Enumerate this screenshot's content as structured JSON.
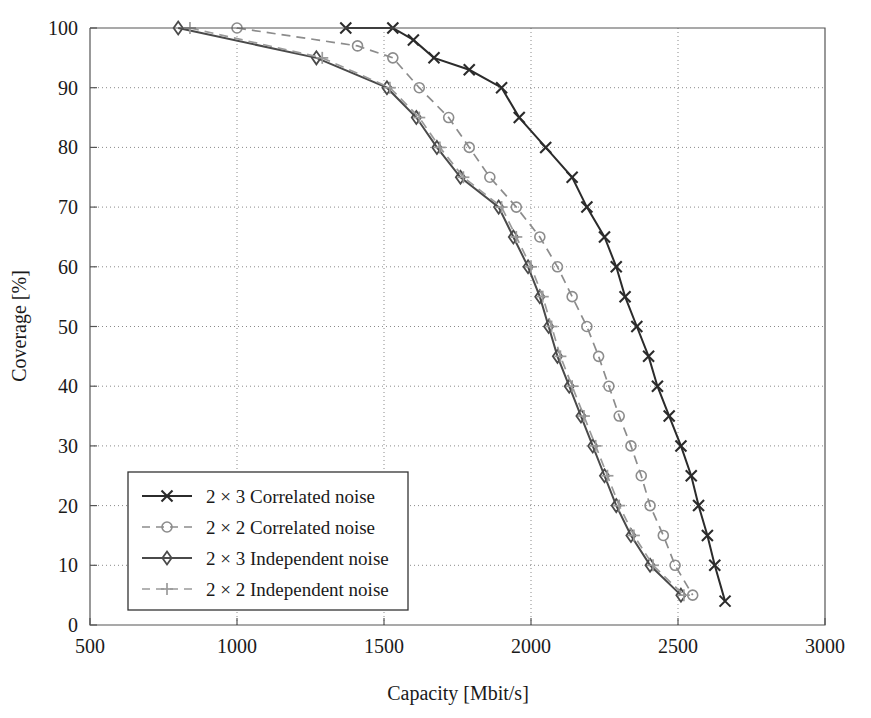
{
  "figure": {
    "title": "",
    "background": "#ffffff"
  },
  "axes": {
    "x_title": "Capacity [Mbit/s]",
    "y_title": "Coverage [%]",
    "x_ticks": [
      "500",
      "1000",
      "1500",
      "2000",
      "2500",
      "3000"
    ],
    "y_ticks": [
      "0",
      "10",
      "20",
      "30",
      "40",
      "50",
      "60",
      "70",
      "80",
      "90",
      "100"
    ]
  },
  "legend": {
    "items": [
      {
        "label": "2 × 3 Correlated noise",
        "marker": "x",
        "style": "solid",
        "color": "#2b2b2b"
      },
      {
        "label": "2 × 2 Correlated noise",
        "marker": "circle",
        "style": "dashed",
        "color": "#8c8c8c"
      },
      {
        "label": "2 × 3 Independent noise",
        "marker": "diamond",
        "style": "solid",
        "color": "#4a4a4a"
      },
      {
        "label": "2 × 2 Independent noise",
        "marker": "plus",
        "style": "dashed",
        "color": "#9a9a9a"
      }
    ]
  },
  "chart_data": {
    "type": "line",
    "title": "",
    "xlabel": "Capacity [Mbit/s]",
    "ylabel": "Coverage [%]",
    "xlim": [
      500,
      3000
    ],
    "ylim": [
      0,
      100
    ],
    "xticks": [
      500,
      1000,
      1500,
      2000,
      2500,
      3000
    ],
    "yticks": [
      0,
      10,
      20,
      30,
      40,
      50,
      60,
      70,
      80,
      90,
      100
    ],
    "grid": true,
    "legend_position": "lower-left",
    "series": [
      {
        "name": "2 × 3 Correlated noise",
        "marker": "x",
        "style": "solid",
        "color": "#2b2b2b",
        "points": [
          [
            1370,
            100
          ],
          [
            1530,
            100
          ],
          [
            1600,
            98
          ],
          [
            1670,
            95
          ],
          [
            1790,
            93
          ],
          [
            1900,
            90
          ],
          [
            1960,
            85
          ],
          [
            2050,
            80
          ],
          [
            2140,
            75
          ],
          [
            2190,
            70
          ],
          [
            2250,
            65
          ],
          [
            2290,
            60
          ],
          [
            2320,
            55
          ],
          [
            2360,
            50
          ],
          [
            2400,
            45
          ],
          [
            2430,
            40
          ],
          [
            2470,
            35
          ],
          [
            2510,
            30
          ],
          [
            2545,
            25
          ],
          [
            2570,
            20
          ],
          [
            2600,
            15
          ],
          [
            2625,
            10
          ],
          [
            2660,
            4
          ]
        ]
      },
      {
        "name": "2 × 2 Correlated noise",
        "marker": "circle",
        "style": "dashed",
        "color": "#8c8c8c",
        "points": [
          [
            1000,
            100
          ],
          [
            1410,
            97
          ],
          [
            1530,
            95
          ],
          [
            1620,
            90
          ],
          [
            1720,
            85
          ],
          [
            1790,
            80
          ],
          [
            1860,
            75
          ],
          [
            1950,
            70
          ],
          [
            2030,
            65
          ],
          [
            2090,
            60
          ],
          [
            2140,
            55
          ],
          [
            2190,
            50
          ],
          [
            2230,
            45
          ],
          [
            2265,
            40
          ],
          [
            2300,
            35
          ],
          [
            2340,
            30
          ],
          [
            2375,
            25
          ],
          [
            2405,
            20
          ],
          [
            2450,
            15
          ],
          [
            2490,
            10
          ],
          [
            2550,
            5
          ]
        ]
      },
      {
        "name": "2 × 3 Independent noise",
        "marker": "diamond",
        "style": "solid",
        "color": "#4a4a4a",
        "points": [
          [
            800,
            100
          ],
          [
            1270,
            95
          ],
          [
            1510,
            90
          ],
          [
            1610,
            85
          ],
          [
            1680,
            80
          ],
          [
            1760,
            75
          ],
          [
            1890,
            70
          ],
          [
            1940,
            65
          ],
          [
            1990,
            60
          ],
          [
            2030,
            55
          ],
          [
            2060,
            50
          ],
          [
            2090,
            45
          ],
          [
            2130,
            40
          ],
          [
            2170,
            35
          ],
          [
            2210,
            30
          ],
          [
            2250,
            25
          ],
          [
            2290,
            20
          ],
          [
            2340,
            15
          ],
          [
            2405,
            10
          ],
          [
            2510,
            5
          ]
        ]
      },
      {
        "name": "2 × 2 Independent noise",
        "marker": "plus",
        "style": "dashed",
        "color": "#9a9a9a",
        "points": [
          [
            840,
            100
          ],
          [
            1290,
            95
          ],
          [
            1520,
            90
          ],
          [
            1620,
            85
          ],
          [
            1690,
            80
          ],
          [
            1770,
            75
          ],
          [
            1900,
            70
          ],
          [
            1950,
            65
          ],
          [
            2000,
            60
          ],
          [
            2040,
            55
          ],
          [
            2070,
            50
          ],
          [
            2100,
            45
          ],
          [
            2140,
            40
          ],
          [
            2180,
            35
          ],
          [
            2220,
            30
          ],
          [
            2260,
            25
          ],
          [
            2300,
            20
          ],
          [
            2350,
            15
          ],
          [
            2415,
            10
          ],
          [
            2520,
            5
          ]
        ]
      }
    ]
  }
}
